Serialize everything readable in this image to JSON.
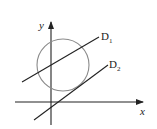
{
  "diagram": {
    "type": "geometry",
    "axes": {
      "x_label": "x",
      "y_label": "y"
    },
    "circle": {
      "cx": 63,
      "cy": 65,
      "r": 26,
      "color": "#8a8a8a"
    },
    "lines": [
      {
        "id": "D1",
        "label": "D",
        "subscript": "1",
        "relation": "secant"
      },
      {
        "id": "D2",
        "label": "D",
        "subscript": "2",
        "relation": "tangent"
      }
    ],
    "colors": {
      "stroke": "#222222",
      "circle": "#8a8a8a",
      "background": "#ffffff"
    }
  }
}
